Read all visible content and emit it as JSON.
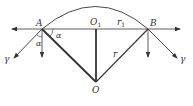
{
  "diagram": {
    "type": "geometry-optics",
    "colors": {
      "line": "#333333",
      "background": "#ffffff"
    },
    "points": {
      "A": {
        "label": "A",
        "x": 42,
        "y": 29
      },
      "B": {
        "label": "B",
        "x": 148,
        "y": 29
      },
      "O1": {
        "label": "O",
        "subscript": "1",
        "x": 96,
        "y": 29
      },
      "O": {
        "label": "O",
        "x": 96,
        "y": 82
      }
    },
    "labels": {
      "A": "A",
      "B": "B",
      "O1_main": "O",
      "O1_sub": "1",
      "O": "O",
      "r1_main": "r",
      "r1_sub": "1",
      "r": "r",
      "alpha_left": "α",
      "alpha_right": "α",
      "gamma_left": "γ",
      "gamma_right": "γ"
    },
    "elements": [
      "arc from A to B over O1",
      "horizontal line with arrows both ends through A, O1, B",
      "segment A-O (thick)",
      "segment O1-O (thick)",
      "segment B-O labeled r",
      "segment O1-B labeled r1",
      "arrow from A down-left labeled γ",
      "arrow from B down-right labeled γ",
      "vertical arrows downward from A and B",
      "angle α at A between horizontal and AO",
      "angle α at A between vertical and γ ray"
    ]
  }
}
